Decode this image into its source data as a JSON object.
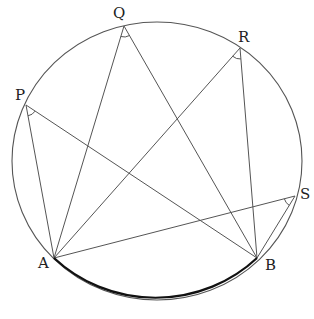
{
  "diagram": {
    "type": "inscribed-angles-on-circle",
    "circle": {
      "cx": 157,
      "cy": 161,
      "rx": 145,
      "ry": 139,
      "stroke": "#555555"
    },
    "arc_AB": {
      "stroke": "#111111",
      "width": 2.2
    },
    "points": {
      "A": {
        "label": "A",
        "x": 54,
        "y": 258,
        "lx": 38,
        "ly": 268
      },
      "B": {
        "label": "B",
        "x": 257,
        "y": 258,
        "lx": 265,
        "ly": 270
      },
      "P": {
        "label": "P",
        "x": 26,
        "y": 105,
        "lx": 15,
        "ly": 100
      },
      "Q": {
        "label": "Q",
        "x": 124,
        "y": 26,
        "lx": 113,
        "ly": 18
      },
      "R": {
        "label": "R",
        "x": 240,
        "y": 48,
        "lx": 238,
        "ly": 42
      },
      "S": {
        "label": "S",
        "x": 295,
        "y": 196,
        "lx": 300,
        "ly": 199
      }
    },
    "segments": [
      [
        "P",
        "A"
      ],
      [
        "P",
        "B"
      ],
      [
        "Q",
        "A"
      ],
      [
        "Q",
        "B"
      ],
      [
        "R",
        "A"
      ],
      [
        "R",
        "B"
      ],
      [
        "S",
        "A"
      ],
      [
        "S",
        "B"
      ]
    ],
    "angle_marks": [
      "P",
      "Q",
      "R",
      "S"
    ]
  }
}
